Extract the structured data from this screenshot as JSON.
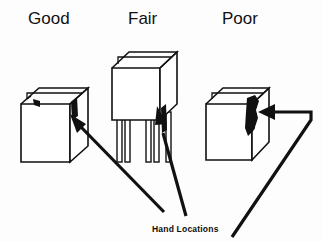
{
  "figure": {
    "title_row": [
      {
        "id": "good",
        "label": "Good",
        "x": 28,
        "y": 24
      },
      {
        "id": "fair",
        "label": "Fair",
        "x": 128,
        "y": 24
      },
      {
        "id": "poor",
        "label": "Poor",
        "x": 222,
        "y": 24
      }
    ],
    "caption": {
      "label": "Hand Locations",
      "x": 152,
      "y": 232
    },
    "panels": [
      {
        "id": "good",
        "rating": "Good",
        "description": "Box at waist height, hands on inner side walls near top",
        "hand_marks": 2,
        "has_stand": false,
        "arrow_count": 1
      },
      {
        "id": "fair",
        "rating": "Fair",
        "description": "Box elevated on a four-leg stand, hand on lower outer side",
        "hand_marks": 1,
        "has_stand": true,
        "arrow_count": 1
      },
      {
        "id": "poor",
        "rating": "Poor",
        "description": "Fingers gripping outer side edge of box",
        "hand_marks": 1,
        "has_stand": false,
        "arrow_count": 1
      }
    ],
    "colors": {
      "ink": "#111111",
      "background": "#fdfdfd",
      "face": "#ffffff"
    }
  }
}
